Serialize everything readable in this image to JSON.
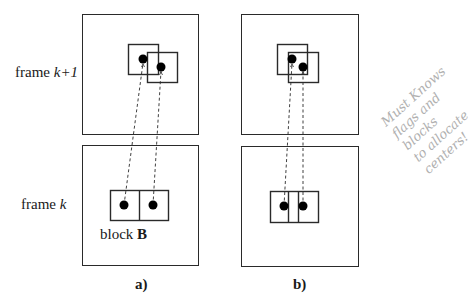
{
  "labels": {
    "frame_k1": {
      "prefix": "frame ",
      "var": "k+1"
    },
    "frame_k": {
      "prefix": "frame ",
      "var": "k"
    },
    "block": {
      "prefix": "block ",
      "var": "B"
    },
    "panel_a": "a)",
    "panel_b": "b)"
  },
  "handwritten_note": {
    "lines": [
      "Must Knows",
      "flags and blocks",
      "to allocate",
      "centers!"
    ]
  },
  "panels": [
    {
      "id": "a",
      "top_frame": {
        "x": 82,
        "y": 14,
        "w": 116,
        "h": 120
      },
      "bottom_frame": {
        "x": 82,
        "y": 145,
        "w": 116,
        "h": 120
      },
      "top_blocks": [
        {
          "x": 128,
          "y": 44,
          "w": 30,
          "h": 30
        },
        {
          "x": 147,
          "y": 52,
          "w": 30,
          "h": 30
        }
      ],
      "top_dots": [
        {
          "x": 143,
          "y": 59
        },
        {
          "x": 161,
          "y": 67
        }
      ],
      "bottom_block": {
        "x": 110,
        "y": 190,
        "w": 58,
        "h": 30,
        "dividers": [
          139
        ]
      },
      "bottom_dots": [
        {
          "x": 124,
          "y": 205
        },
        {
          "x": 153,
          "y": 205
        }
      ]
    },
    {
      "id": "b",
      "top_frame": {
        "x": 241,
        "y": 14,
        "w": 117,
        "h": 120
      },
      "bottom_frame": {
        "x": 241,
        "y": 146,
        "w": 117,
        "h": 120
      },
      "top_blocks": [
        {
          "x": 277,
          "y": 44,
          "w": 30,
          "h": 30
        },
        {
          "x": 288,
          "y": 52,
          "w": 30,
          "h": 30
        }
      ],
      "top_dots": [
        {
          "x": 292,
          "y": 59
        },
        {
          "x": 303,
          "y": 67
        }
      ],
      "bottom_block": {
        "x": 270,
        "y": 191,
        "w": 48,
        "h": 31,
        "dividers": [
          288,
          298
        ]
      },
      "bottom_dots": [
        {
          "x": 284,
          "y": 206
        },
        {
          "x": 303,
          "y": 206
        }
      ]
    }
  ],
  "colors": {
    "stroke": "#2a2a2a",
    "dots": "#000000",
    "note": "#b0b0b0"
  }
}
